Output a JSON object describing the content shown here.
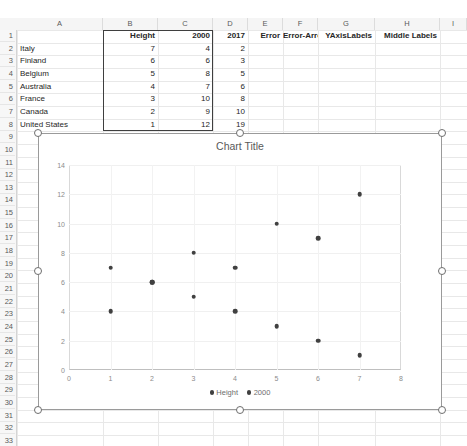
{
  "app": {
    "type": "spreadsheet"
  },
  "grid": {
    "column_letters": [
      "A",
      "B",
      "C",
      "D",
      "E",
      "F",
      "G",
      "H",
      "I"
    ],
    "row_numbers": [
      "1",
      "2",
      "3",
      "4",
      "5",
      "6",
      "7",
      "8",
      "9",
      "10",
      "11",
      "12",
      "13",
      "14",
      "15",
      "16",
      "17",
      "18",
      "19",
      "20",
      "21",
      "22",
      "23",
      "24",
      "25",
      "26",
      "27",
      "28",
      "29",
      "30",
      "31",
      "32",
      "33"
    ]
  },
  "table": {
    "headers": {
      "a": "",
      "b": "Height",
      "c": "2000",
      "d": "2017",
      "e": "Error",
      "f": "Error-Arrow",
      "g": "YAxisLabels",
      "h": "Middle Labels"
    },
    "rows": [
      {
        "row": "2",
        "country": "Italy",
        "height": "7",
        "y2000": "4",
        "y2017": "2"
      },
      {
        "row": "3",
        "country": "Finland",
        "height": "6",
        "y2000": "6",
        "y2017": "3"
      },
      {
        "row": "4",
        "country": "Belgium",
        "height": "5",
        "y2000": "8",
        "y2017": "5"
      },
      {
        "row": "5",
        "country": "Australia",
        "height": "4",
        "y2000": "7",
        "y2017": "6"
      },
      {
        "row": "6",
        "country": "France",
        "height": "3",
        "y2000": "10",
        "y2017": "8"
      },
      {
        "row": "7",
        "country": "Canada",
        "height": "2",
        "y2000": "9",
        "y2017": "10"
      },
      {
        "row": "8",
        "country": "United States",
        "height": "1",
        "y2000": "12",
        "y2017": "19"
      }
    ],
    "selection_range": "B1:C8"
  },
  "chart_data": {
    "type": "scatter",
    "title": "Chart Title",
    "xlabel": "",
    "ylabel": "",
    "xlim": [
      0,
      8
    ],
    "ylim": [
      0,
      14
    ],
    "xticks": [
      "0",
      "1",
      "2",
      "3",
      "4",
      "5",
      "6",
      "7",
      "8"
    ],
    "yticks": [
      "0",
      "2",
      "4",
      "6",
      "8",
      "10",
      "12",
      "14"
    ],
    "grid": true,
    "legend_position": "bottom",
    "marker_color": "#404040",
    "series": [
      {
        "name": "Height",
        "x": [
          1,
          2,
          3,
          4,
          5,
          6,
          7
        ],
        "values": [
          7,
          6,
          5,
          4,
          3,
          2,
          1
        ]
      },
      {
        "name": "2000",
        "x": [
          1,
          2,
          3,
          4,
          5,
          6,
          7
        ],
        "values": [
          4,
          6,
          8,
          7,
          10,
          9,
          12
        ]
      }
    ]
  }
}
